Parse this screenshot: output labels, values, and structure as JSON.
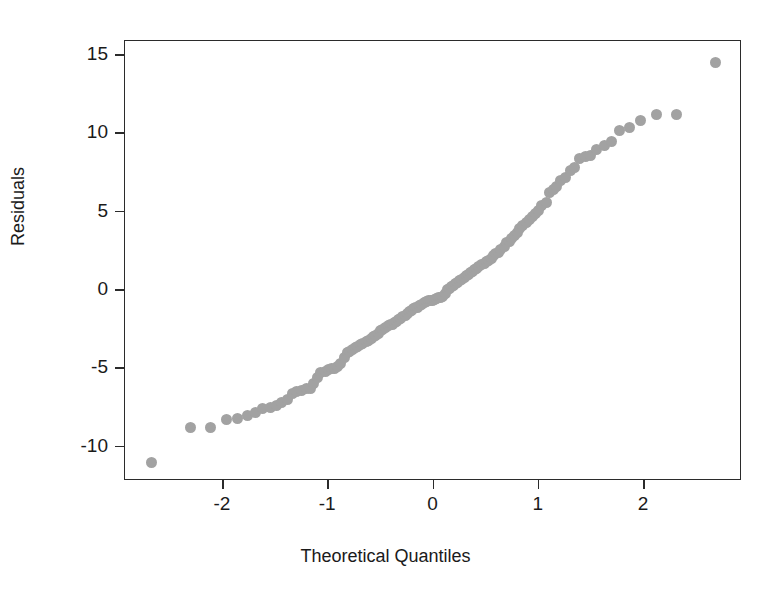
{
  "chart_data": {
    "type": "scatter",
    "title": "",
    "xlabel": "Theoretical Quantiles",
    "ylabel": "Residuals",
    "xlim": [
      -2.93,
      2.93
    ],
    "ylim": [
      -12.2,
      15.9
    ],
    "xticks": [
      -2,
      -1,
      0,
      1,
      2
    ],
    "xticklabels": [
      "-2",
      "-1",
      "0",
      "1",
      "2"
    ],
    "yticks": [
      -10,
      -5,
      0,
      5,
      10,
      15
    ],
    "yticklabels": [
      "-10",
      "-5",
      "0",
      "5",
      "10",
      "15"
    ],
    "grid": false,
    "legend": null,
    "marker": {
      "shape": "circle",
      "color": "#a2a2a2",
      "size_px": 11,
      "filled": true
    },
    "frame": {
      "box": true,
      "color": "#2b2b2b"
    },
    "series": [
      {
        "name": "residual quantiles",
        "x": [
          -2.68,
          -2.31,
          -2.12,
          -1.97,
          -1.86,
          -1.77,
          -1.69,
          -1.62,
          -1.55,
          -1.49,
          -1.44,
          -1.39,
          -1.34,
          -1.3,
          -1.25,
          -1.21,
          -1.17,
          -1.14,
          -1.1,
          -1.07,
          -1.03,
          -1.0,
          -0.97,
          -0.94,
          -0.91,
          -0.88,
          -0.85,
          -0.82,
          -0.8,
          -0.77,
          -0.74,
          -0.72,
          -0.69,
          -0.67,
          -0.64,
          -0.62,
          -0.59,
          -0.57,
          -0.55,
          -0.52,
          -0.5,
          -0.48,
          -0.46,
          -0.43,
          -0.41,
          -0.39,
          -0.37,
          -0.35,
          -0.33,
          -0.31,
          -0.29,
          -0.27,
          -0.25,
          -0.23,
          -0.21,
          -0.19,
          -0.17,
          -0.15,
          -0.13,
          -0.11,
          -0.09,
          -0.07,
          -0.05,
          -0.03,
          -0.01,
          0.01,
          0.03,
          0.05,
          0.07,
          0.09,
          0.11,
          0.13,
          0.15,
          0.17,
          0.19,
          0.21,
          0.23,
          0.25,
          0.27,
          0.29,
          0.31,
          0.33,
          0.35,
          0.37,
          0.39,
          0.41,
          0.43,
          0.46,
          0.48,
          0.5,
          0.52,
          0.55,
          0.57,
          0.59,
          0.62,
          0.64,
          0.67,
          0.69,
          0.72,
          0.74,
          0.77,
          0.8,
          0.82,
          0.85,
          0.88,
          0.91,
          0.94,
          0.97,
          1.0,
          1.03,
          1.07,
          1.1,
          1.14,
          1.17,
          1.21,
          1.25,
          1.3,
          1.34,
          1.39,
          1.44,
          1.49,
          1.55,
          1.62,
          1.69,
          1.77,
          1.86,
          1.97,
          2.12,
          2.31,
          2.68
        ],
        "y": [
          -11.0,
          -8.8,
          -8.8,
          -8.3,
          -8.2,
          -8.0,
          -7.8,
          -7.6,
          -7.5,
          -7.4,
          -7.2,
          -7.0,
          -6.6,
          -6.5,
          -6.4,
          -6.3,
          -6.3,
          -6.0,
          -5.6,
          -5.3,
          -5.2,
          -5.1,
          -5.0,
          -5.0,
          -4.9,
          -4.7,
          -4.3,
          -4.0,
          -3.9,
          -3.8,
          -3.7,
          -3.6,
          -3.5,
          -3.4,
          -3.3,
          -3.2,
          -3.1,
          -3.0,
          -2.9,
          -2.8,
          -2.6,
          -2.5,
          -2.4,
          -2.3,
          -2.2,
          -2.2,
          -2.1,
          -2.0,
          -1.9,
          -1.8,
          -1.7,
          -1.6,
          -1.5,
          -1.4,
          -1.3,
          -1.2,
          -1.15,
          -1.1,
          -1.0,
          -0.9,
          -0.8,
          -0.75,
          -0.7,
          -0.7,
          -0.65,
          -0.6,
          -0.55,
          -0.5,
          -0.45,
          -0.4,
          -0.2,
          0.0,
          0.1,
          0.2,
          0.3,
          0.4,
          0.5,
          0.6,
          0.7,
          0.8,
          0.9,
          1.0,
          1.1,
          1.2,
          1.3,
          1.4,
          1.5,
          1.6,
          1.7,
          1.8,
          1.9,
          2.0,
          2.2,
          2.3,
          2.4,
          2.6,
          2.8,
          3.0,
          3.1,
          3.3,
          3.5,
          3.7,
          3.9,
          4.1,
          4.3,
          4.5,
          4.7,
          4.9,
          5.1,
          5.4,
          5.6,
          6.2,
          6.4,
          6.6,
          7.0,
          7.2,
          7.6,
          7.8,
          8.4,
          8.5,
          8.6,
          9.0,
          9.2,
          9.5,
          10.2,
          10.4,
          10.8,
          11.2,
          11.2,
          14.5
        ]
      }
    ]
  }
}
